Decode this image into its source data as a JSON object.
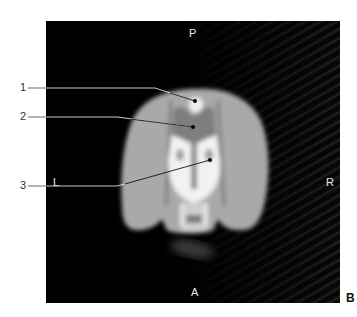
{
  "figure": {
    "panel_label": "B",
    "orientation": {
      "top": "P",
      "bottom": "A",
      "left": "L",
      "right": "R"
    },
    "callouts": [
      {
        "number": "1",
        "label_x": 20,
        "label_y": 87,
        "target_x": 195,
        "target_y": 101
      },
      {
        "number": "2",
        "label_x": 20,
        "label_y": 116,
        "target_x": 193,
        "target_y": 127
      },
      {
        "number": "3",
        "label_x": 20,
        "label_y": 185,
        "target_x": 210,
        "target_y": 160
      }
    ],
    "colors": {
      "background": "#050505",
      "tissue": "#a8a8a8",
      "bright": "#f4f4f4",
      "leader_line": "#1a1a1a"
    }
  }
}
